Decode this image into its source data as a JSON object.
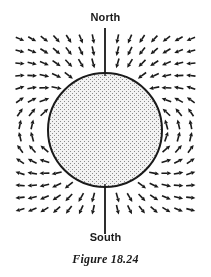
{
  "figure": {
    "caption": "Figure 18.24",
    "width": 211,
    "height": 277,
    "background_color": "#ffffff",
    "ink_color": "#1a1a1a"
  },
  "labels": {
    "north": "North",
    "south": "South"
  },
  "sphere": {
    "center_x": 105,
    "center_y": 130,
    "radius": 57,
    "fill_color": "#d0d0d0",
    "stroke_color": "#1a1a1a",
    "stroke_width": 2,
    "texture": "stipple-halftone",
    "texture_dot_color": "#8a8a8a",
    "texture_cell": 2
  },
  "axis": {
    "label": "magnetic-axis",
    "x": 105,
    "top_y": 28,
    "bottom_y": 234,
    "color": "#1a1a1a",
    "width": 1.4
  },
  "chart_data": {
    "type": "vector-field",
    "title": "Figure 18.24",
    "field_model": "magnetic dipole",
    "dipole_moment_direction_deg": 90,
    "grid": {
      "x_start": 20,
      "y_start": 39,
      "columns": 15,
      "rows": 15,
      "spacing_x": 12.2,
      "spacing_y": 12.2
    },
    "arrow": {
      "length": 9.5,
      "head_length": 4.2,
      "head_width": 4.0,
      "shaft_width": 1.6,
      "color": "#1a1a1a"
    },
    "annotations": [
      {
        "text": "North",
        "x": 105,
        "y": 18
      },
      {
        "text": "South",
        "x": 105,
        "y": 238
      }
    ]
  }
}
